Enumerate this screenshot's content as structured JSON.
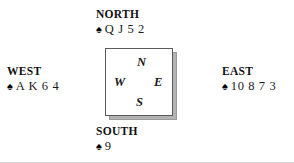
{
  "diagram": {
    "type": "bridge-hand-diagram",
    "suit_symbol": "♠",
    "suit_name": "spades",
    "hands": [
      {
        "position": "north",
        "label": "NORTH",
        "cards": "Q J 5 2"
      },
      {
        "position": "west",
        "label": "WEST",
        "cards": "A K 6 4"
      },
      {
        "position": "east",
        "label": "EAST",
        "cards": "10 8 7 3"
      },
      {
        "position": "south",
        "label": "SOUTH",
        "cards": "9"
      }
    ],
    "compass": {
      "north": "N",
      "west": "W",
      "east": "E",
      "south": "S"
    },
    "colors": {
      "text": "#1a1a1a",
      "box_border": "#5a5a5a",
      "box_shadow": "#b3b3b3",
      "background": "#ffffff"
    }
  }
}
